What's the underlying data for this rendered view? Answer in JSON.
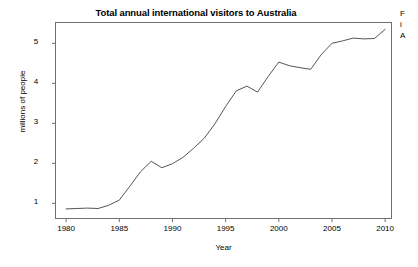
{
  "chart_data": {
    "type": "line",
    "title": "Total annual international visitors to Australia",
    "xlabel": "Year",
    "ylabel": "millions of people",
    "xlim": [
      1979.0,
      2010.6
    ],
    "ylim": [
      0.62,
      5.52
    ],
    "xticks": [
      1980,
      1985,
      1990,
      1995,
      2000,
      2005,
      2010
    ],
    "xtick_labels": [
      "1980",
      "1985",
      "1990",
      "1995",
      "2000",
      "2005",
      "2010"
    ],
    "yticks": [
      1,
      2,
      3,
      4,
      5
    ],
    "ytick_labels": [
      "1",
      "2",
      "3",
      "4",
      "5"
    ],
    "grid": false,
    "legend": null,
    "line_color": "#555555",
    "x": [
      1980,
      1981,
      1982,
      1983,
      1984,
      1985,
      1986,
      1987,
      1988,
      1989,
      1990,
      1991,
      1992,
      1993,
      1994,
      1995,
      1996,
      1997,
      1998,
      1999,
      2000,
      2001,
      2002,
      2003,
      2004,
      2005,
      2006,
      2007,
      2008,
      2009,
      2010
    ],
    "values": [
      0.86,
      0.87,
      0.88,
      0.87,
      0.95,
      1.08,
      1.43,
      1.79,
      2.05,
      1.89,
      1.99,
      2.15,
      2.38,
      2.63,
      2.99,
      3.42,
      3.81,
      3.93,
      3.78,
      4.17,
      4.53,
      4.44,
      4.39,
      4.35,
      4.72,
      5.0,
      5.06,
      5.13,
      5.11,
      5.12,
      5.35
    ],
    "annotations": [
      {
        "year": 1988,
        "note": "peak"
      },
      {
        "year": 1989,
        "note": "dip"
      },
      {
        "year": 1998,
        "note": "dip"
      },
      {
        "year": 2000,
        "note": "peak"
      },
      {
        "year": 2003,
        "note": "trough"
      }
    ]
  },
  "side_note": {
    "line1": "F",
    "line2": "i",
    "line3": "A"
  }
}
